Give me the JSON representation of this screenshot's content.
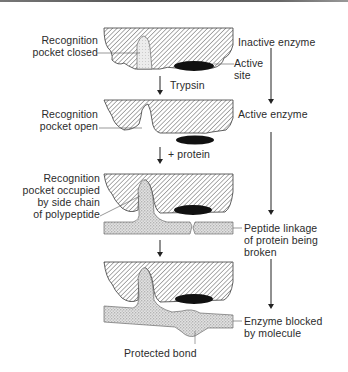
{
  "diagram": {
    "type": "enzyme-mechanism",
    "stages": [
      {
        "id": "inactive",
        "state_label": "Inactive enzyme",
        "left_label": [
          "Recognition",
          "pocket closed"
        ],
        "side_label": [
          "Active",
          "site"
        ]
      },
      {
        "id": "active",
        "state_label": "Active enzyme",
        "left_label": [
          "Recognition",
          "pocket open"
        ]
      },
      {
        "id": "bound",
        "left_label": [
          "Recognition",
          "pocket occupied",
          "by side chain",
          "of polypeptide"
        ],
        "side_label": [
          "Peptide linkage",
          "of protein being",
          "broken"
        ]
      },
      {
        "id": "blocked",
        "side_label": [
          "Enzyme blocked",
          "by molecule"
        ],
        "bottom_label": "Protected bond"
      }
    ],
    "transitions": [
      {
        "from": "inactive",
        "to": "active",
        "label": "Trypsin"
      },
      {
        "from": "active",
        "to": "bound",
        "label": "+ protein"
      },
      {
        "from": "bound",
        "to": "blocked",
        "label": ""
      }
    ],
    "colors": {
      "hatch": "#3a3a3a",
      "active_site": "#111111",
      "stipple": "#9a9a9a",
      "line": "#333333"
    }
  }
}
